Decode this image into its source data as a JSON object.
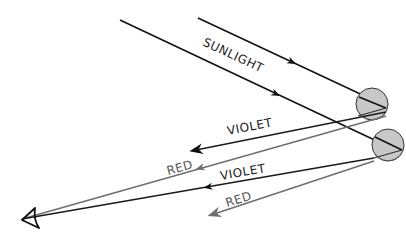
{
  "diagram": {
    "type": "rainbow-formation",
    "labels": {
      "sunlight": "SUNLIGHT",
      "violet_upper": "VIOLET",
      "red_upper": "RED",
      "violet_lower": "VIOLET",
      "red_lower": "RED"
    },
    "colors": {
      "sunlight": "#111111",
      "violet": "#1a1a1a",
      "red": "#6e6e6e",
      "droplet_fill": "#c8c8c8",
      "droplet_stroke": "#333333",
      "label": "#222222",
      "red_label": "#555555"
    },
    "elements": {
      "droplets": [
        {
          "name": "upper-raindrop",
          "cx": 372,
          "cy": 104,
          "r": 16
        },
        {
          "name": "lower-raindrop",
          "cx": 388,
          "cy": 145,
          "r": 16
        }
      ],
      "observer": {
        "name": "eye",
        "x": 22,
        "y": 220
      }
    }
  }
}
